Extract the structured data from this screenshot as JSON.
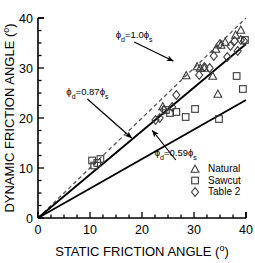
{
  "chart_data": {
    "type": "scatter",
    "title": "",
    "xlabel": "STATIC FRICTION ANGLE (o)",
    "ylabel": "DYNAMIC FRICTION ANGLE (o)",
    "xlim": [
      0,
      40
    ],
    "ylim": [
      0,
      40
    ],
    "xticks": [
      0,
      10,
      20,
      30,
      40
    ],
    "yticks": [
      0,
      10,
      20,
      30,
      40
    ],
    "xtick_labels": [
      "0",
      "10",
      "20",
      "30",
      "40"
    ],
    "ytick_labels": [
      "0",
      "10",
      "20",
      "30",
      "40"
    ],
    "minor_tick_step": 2.5,
    "grid": false,
    "legend_position": "lower-right",
    "series": [
      {
        "name": "Natural",
        "marker": "triangle",
        "points": [
          [
            24.0,
            22.3
          ],
          [
            28.5,
            28.5
          ],
          [
            30.6,
            30.3
          ],
          [
            31.2,
            30.0
          ],
          [
            32.0,
            30.0
          ],
          [
            33.6,
            28.4
          ],
          [
            34.2,
            33.8
          ],
          [
            34.6,
            24.8
          ],
          [
            35.2,
            34.6
          ],
          [
            36.0,
            35.2
          ],
          [
            38.0,
            36.6
          ],
          [
            39.0,
            37.6
          ]
        ]
      },
      {
        "name": "Sawcut",
        "marker": "square",
        "points": [
          [
            10.4,
            11.5
          ],
          [
            10.8,
            10.5
          ],
          [
            11.4,
            11.0
          ],
          [
            12.0,
            11.8
          ],
          [
            24.6,
            21.6
          ],
          [
            25.4,
            21.0
          ],
          [
            26.6,
            21.2
          ],
          [
            28.4,
            20.2
          ],
          [
            30.2,
            21.8
          ],
          [
            34.8,
            19.8
          ],
          [
            38.2,
            28.4
          ],
          [
            39.4,
            25.8
          ],
          [
            39.8,
            35.6
          ]
        ]
      },
      {
        "name": "Table 2",
        "marker": "diamond",
        "points": [
          [
            22.6,
            19.6
          ],
          [
            23.4,
            20.0
          ],
          [
            24.2,
            21.6
          ],
          [
            25.8,
            22.2
          ],
          [
            26.6,
            24.6
          ],
          [
            31.0,
            28.6
          ],
          [
            32.0,
            30.2
          ],
          [
            33.0,
            30.0
          ],
          [
            33.8,
            32.4
          ],
          [
            35.0,
            34.8
          ],
          [
            36.4,
            32.2
          ],
          [
            37.0,
            34.4
          ],
          [
            37.8,
            35.4
          ],
          [
            38.4,
            33.4
          ],
          [
            39.0,
            35.6
          ],
          [
            39.6,
            35.4
          ]
        ]
      }
    ],
    "reference_lines": [
      {
        "label": "phi_d=1.0*phi_s",
        "slope": 1.0,
        "style": "dashed",
        "x_from": 0,
        "x_to": 40
      },
      {
        "label": "phi_d=0.87*phi_s",
        "slope": 0.87,
        "style": "solid",
        "x_from": 0,
        "x_to": 40
      },
      {
        "label": "phi_d=0.59*phi_s",
        "slope": 0.59,
        "style": "solid",
        "x_from": 0,
        "x_to": 40
      }
    ],
    "annotations": [
      {
        "id": "ann-10",
        "text_prefix": "ϕ",
        "text_sub": "d",
        "text_mid": "=1.0",
        "text_phi2": "ϕ",
        "text_sub2": "s",
        "full_text": "ϕd=1.0ϕs",
        "text_xy": [
          18.5,
          36.0
        ],
        "arrow_to": [
          26.0,
          31.4
        ]
      },
      {
        "id": "ann-087",
        "full_text": "ϕd=0.87ϕs",
        "text_xy": [
          9.5,
          24.6
        ],
        "arrow_to": [
          18.0,
          16.0
        ]
      },
      {
        "id": "ann-059",
        "full_text": "ϕd=0.59ϕs",
        "text_xy": [
          26.5,
          12.4
        ],
        "arrow_to": [
          22.0,
          17.5
        ]
      }
    ],
    "colors": {
      "axis": "#000000",
      "marker_stroke": "#3a3a3a",
      "line": "#000000",
      "dashed_line": "#555555",
      "background": "#ffffff"
    }
  },
  "legend": {
    "entries": [
      {
        "label": "Natural",
        "marker": "triangle"
      },
      {
        "label": "Sawcut",
        "marker": "square"
      },
      {
        "label": "Table 2",
        "marker": "diamond"
      }
    ]
  },
  "axes": {
    "x_label_main": "STATIC FRICTION ANGLE (",
    "x_label_deg": "o",
    "x_label_close": ")",
    "y_label_main": "DYNAMIC FRICTION ANGLE (",
    "y_label_deg": "o",
    "y_label_close": ")"
  }
}
